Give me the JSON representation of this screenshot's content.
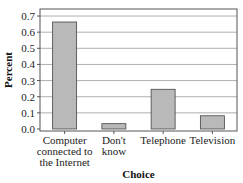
{
  "chart_data": {
    "type": "bar",
    "title": "",
    "xlabel": "Choice",
    "ylabel": "Percent",
    "categories": [
      [
        "Computer",
        "connected to",
        "the Internet"
      ],
      [
        "Don't",
        "know"
      ],
      [
        "Telephone"
      ],
      [
        "Television"
      ]
    ],
    "values": [
      0.663,
      0.033,
      0.246,
      0.082
    ],
    "ylim": [
      0,
      0.72
    ],
    "yticks": [
      "0.0",
      "0.1",
      "0.2",
      "0.3",
      "0.4",
      "0.5",
      "0.6",
      "0.7"
    ],
    "grid": true,
    "legend": "none",
    "colors": {
      "bar_fill": "#b9b9b9",
      "bar_stroke": "#444444",
      "grid": "#9a9a9a",
      "axis": "#555555"
    }
  }
}
